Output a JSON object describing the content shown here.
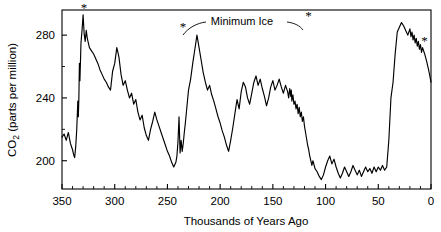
{
  "chart_data": {
    "type": "line",
    "title": "",
    "xlabel": "Thousands of Years Ago",
    "ylabel": "CO2 (parts per million)",
    "ylabel_parts": {
      "prefix": "CO",
      "subscript": "2",
      "suffix": " (parts per million)"
    },
    "xlim": [
      350,
      0
    ],
    "ylim": [
      182,
      296
    ],
    "x_reversed": true,
    "grid": false,
    "legend": null,
    "x_ticks_major": [
      350,
      300,
      250,
      200,
      150,
      100,
      50,
      0
    ],
    "x_tick_labels": [
      "350",
      "300",
      "250",
      "200",
      "150",
      "100",
      "50",
      "0"
    ],
    "x_tick_minor_step": 10,
    "y_ticks_major": [
      200,
      240,
      280
    ],
    "y_tick_labels": [
      "200",
      "240",
      "280"
    ],
    "y_tick_minor": [
      220,
      260
    ],
    "line_color": "#000000",
    "background_color": "#ffffff",
    "annotations": [
      {
        "name": "minimum-ice-label",
        "text": "Minimum Ice",
        "x_px": 242,
        "y_px": 21
      },
      {
        "name": "star-marker-1",
        "text": "*",
        "x_kyr": 333,
        "co2": 293
      },
      {
        "name": "star-marker-2",
        "text": "*",
        "x_kyr": 239,
        "co2": 281
      },
      {
        "name": "star-marker-3",
        "text": "*",
        "x_kyr": 120,
        "co2": 288
      },
      {
        "name": "star-marker-4",
        "text": "*",
        "x_kyr": 10,
        "co2": 272
      }
    ],
    "x": [
      350,
      348,
      346,
      344,
      342,
      340,
      339,
      338,
      337,
      336,
      335,
      334.5,
      334,
      333.5,
      333,
      332,
      331,
      330,
      329,
      328,
      327,
      326,
      324,
      322,
      320,
      318,
      316,
      314,
      312,
      310,
      308,
      306,
      304,
      302,
      300,
      298,
      296,
      294,
      292,
      290,
      288,
      286,
      284,
      282,
      280,
      278,
      276,
      274,
      272,
      270,
      268,
      266,
      264,
      262,
      260,
      258,
      256,
      254,
      252,
      250,
      248,
      246,
      244,
      242,
      241,
      240,
      239,
      238,
      237,
      236,
      235,
      234,
      233,
      232,
      231,
      230,
      228,
      226,
      224,
      222,
      220,
      218,
      216,
      214,
      212,
      210,
      208,
      206,
      204,
      202,
      200,
      198,
      196,
      194,
      192,
      190,
      188,
      186,
      184,
      182,
      180,
      178,
      176,
      174,
      172,
      170,
      168,
      166,
      164,
      162,
      160,
      158,
      156,
      154,
      152,
      150,
      148,
      146,
      144,
      142,
      140,
      138,
      136,
      135,
      134,
      133,
      132.5,
      132,
      131,
      130,
      129,
      128,
      127,
      126,
      125,
      124,
      123,
      122,
      121,
      120,
      119,
      118,
      117,
      116,
      115,
      114,
      113,
      112,
      110,
      108,
      106,
      104,
      102,
      100,
      98,
      96,
      94,
      92,
      90,
      88,
      86,
      84,
      82,
      80,
      78,
      76,
      74,
      72,
      70,
      68,
      66,
      64,
      62,
      60,
      58,
      56,
      54,
      52,
      50,
      48,
      46,
      44,
      42,
      40,
      38,
      36,
      34,
      32,
      30,
      28,
      26,
      24,
      22,
      20,
      19,
      18,
      17,
      16,
      15,
      14,
      13,
      12,
      11,
      10,
      9,
      8,
      6,
      4,
      2,
      0
    ],
    "y": [
      215,
      217,
      213,
      218,
      211,
      207,
      204,
      202,
      209,
      220,
      238,
      228,
      240,
      262,
      251,
      275,
      283,
      293,
      281,
      276,
      283,
      278,
      272,
      270,
      268,
      265,
      262,
      258,
      255,
      252,
      250,
      247,
      245,
      257,
      262,
      272,
      266,
      255,
      248,
      251,
      245,
      240,
      243,
      236,
      239,
      231,
      226,
      229,
      221,
      216,
      213,
      220,
      225,
      231,
      226,
      222,
      218,
      214,
      210,
      206,
      203,
      199,
      196,
      199,
      203,
      212,
      228,
      205,
      213,
      206,
      211,
      218,
      224,
      231,
      238,
      245,
      252,
      262,
      271,
      280,
      272,
      264,
      256,
      250,
      245,
      248,
      242,
      238,
      233,
      228,
      224,
      219,
      215,
      210,
      206,
      213,
      221,
      230,
      239,
      233,
      244,
      250,
      247,
      240,
      236,
      243,
      250,
      254,
      248,
      252,
      246,
      241,
      235,
      240,
      247,
      251,
      245,
      248,
      252,
      247,
      243,
      248,
      244,
      240,
      246,
      241,
      245,
      238,
      242,
      236,
      238,
      233,
      236,
      230,
      234,
      228,
      231,
      225,
      228,
      222,
      218,
      214,
      210,
      207,
      203,
      200,
      197,
      200,
      195,
      193,
      190,
      188,
      191,
      196,
      200,
      203,
      198,
      201,
      196,
      192,
      189,
      192,
      196,
      193,
      190,
      193,
      197,
      194,
      191,
      194,
      190,
      193,
      196,
      193,
      195,
      192,
      196,
      193,
      196,
      194,
      197,
      194,
      196,
      213,
      240,
      250,
      268,
      282,
      285,
      288,
      286,
      283,
      280,
      284,
      279,
      282,
      277,
      280,
      275,
      278,
      273,
      276,
      271,
      274,
      269,
      272,
      268,
      263,
      257,
      250,
      243,
      238,
      235,
      240,
      237,
      241,
      236,
      240,
      235,
      231,
      235,
      229,
      233,
      228,
      232,
      227,
      231,
      226,
      230,
      234,
      238,
      243,
      240,
      236,
      232,
      228,
      232,
      227,
      231,
      226,
      222,
      218,
      214,
      219,
      224,
      220,
      216,
      212,
      217,
      222,
      226,
      222,
      218,
      223,
      228,
      224,
      219,
      214,
      210,
      206,
      202,
      199,
      203,
      208,
      212,
      216,
      221,
      218,
      214,
      210,
      206,
      210,
      214,
      209,
      205,
      201,
      197,
      193,
      196,
      200,
      204,
      200,
      196,
      192,
      188,
      191,
      195,
      199,
      203,
      207,
      211,
      210,
      206,
      202,
      198,
      194,
      190,
      193,
      198,
      203,
      208,
      205,
      205,
      205,
      205,
      203,
      199,
      195,
      191,
      188,
      186,
      189,
      193,
      186,
      184,
      188,
      192,
      196,
      191,
      187,
      190,
      194,
      198,
      202,
      207,
      213,
      219,
      226,
      232,
      238,
      236,
      240,
      245,
      250,
      256,
      262,
      268,
      272,
      268,
      263,
      259,
      264,
      270,
      276,
      272,
      268,
      274,
      280,
      285
    ]
  }
}
